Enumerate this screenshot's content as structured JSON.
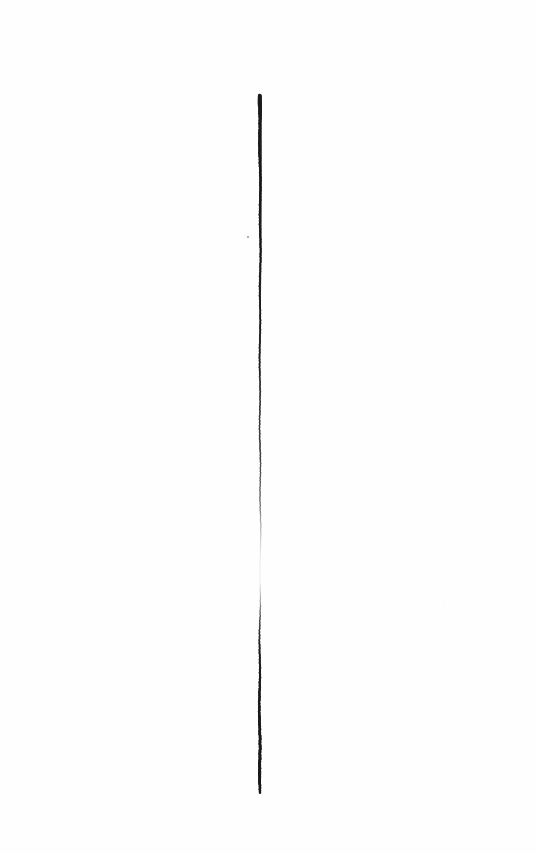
{
  "canvas": {
    "width": 537,
    "height": 853,
    "background_color": "#ffffff",
    "paper_tone": "#fefefe"
  },
  "chart_data": {
    "type": "scatter",
    "title": "",
    "subtitle": "",
    "xlabel": "",
    "ylabel": "",
    "xlim": [
      0,
      537
    ],
    "ylim": [
      0,
      853
    ],
    "grid": false,
    "legend": false,
    "series": [
      {
        "name": "specimen-stroke",
        "color": "#1a1a1a",
        "x": [
          259.5,
          259.6,
          259.8,
          260.0,
          260.1,
          260.2,
          260.2,
          260.1,
          260.0,
          259.9,
          259.8,
          259.8,
          259.9,
          260.0,
          260.2,
          260.4,
          260.5,
          260.4,
          260.2,
          260.0,
          259.8,
          259.7,
          259.6,
          259.6,
          259.7,
          259.9,
          260.1
        ],
        "y": [
          95,
          122,
          149,
          176,
          203,
          230,
          257,
          284,
          311,
          338,
          365,
          392,
          419,
          446,
          473,
          500,
          527,
          554,
          581,
          608,
          635,
          662,
          689,
          716,
          743,
          770,
          793
        ],
        "stroke_width": [
          2.6,
          2.3,
          2.1,
          2.0,
          1.9,
          1.8,
          1.7,
          1.7,
          1.6,
          1.6,
          1.5,
          1.5,
          1.4,
          1.4,
          1.3,
          1.2,
          1.1,
          0.9,
          0.8,
          1.2,
          1.6,
          1.9,
          2.1,
          2.3,
          2.5,
          2.6,
          2.2
        ],
        "opacity": [
          0.97,
          0.93,
          0.88,
          0.84,
          0.8,
          0.76,
          0.72,
          0.69,
          0.65,
          0.62,
          0.58,
          0.54,
          0.5,
          0.46,
          0.4,
          0.3,
          0.16,
          0.05,
          0.04,
          0.26,
          0.52,
          0.7,
          0.82,
          0.9,
          0.94,
          0.96,
          0.88
        ]
      }
    ],
    "annotations": [
      {
        "name": "stroke-head",
        "x": 259.5,
        "y": 99,
        "note": "thickened forked dark tip at top of stroke"
      },
      {
        "name": "fade-gap",
        "x": 260.4,
        "y": 568,
        "note": "stroke nearly vanishes between y 545 and 595"
      },
      {
        "name": "stroke-tip",
        "x": 260.1,
        "y": 793,
        "note": "tapered lower terminus of stroke"
      },
      {
        "name": "ink-speck",
        "x": 248,
        "y": 237,
        "note": "isolated faint dot left of the stroke"
      }
    ]
  },
  "image": {
    "caption": "",
    "alt_text": "A single long thin dark vertical stroke on a blank white page."
  },
  "specimen": {
    "label": "",
    "scale_note": ""
  }
}
